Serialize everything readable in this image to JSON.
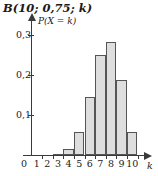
{
  "chart_data": {
    "type": "bar",
    "title": "B(10; 0,75; k)",
    "xlabel": "k",
    "ylabel": "P(X = k)",
    "categories": [
      1,
      2,
      3,
      4,
      5,
      6,
      7,
      8,
      9,
      10
    ],
    "values": [
      0.0,
      0.0004,
      0.0031,
      0.0162,
      0.0584,
      0.146,
      0.2503,
      0.2816,
      0.1877,
      0.0563
    ],
    "xlim": [
      0,
      10
    ],
    "ylim": [
      0,
      0.32
    ],
    "y_ticks": [
      0.1,
      0.2,
      0.3
    ],
    "y_tick_labels": [
      "0,1",
      "0,2",
      "0,3"
    ],
    "x_tick_labels": [
      "1",
      "2",
      "3",
      "4",
      "5",
      "6",
      "7",
      "8",
      "9",
      "10"
    ],
    "origin_label": "0",
    "grid": false,
    "legend": false,
    "bar_fill_color": "#dedede",
    "bar_edge_color": "#555555",
    "axis_color": "#3a3a3a"
  }
}
